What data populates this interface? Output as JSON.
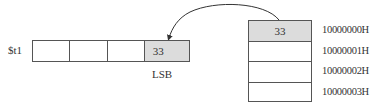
{
  "register": {
    "name": "$t1",
    "bytes": [
      "",
      "",
      "",
      "33"
    ],
    "lsb_label": "LSB"
  },
  "memory": {
    "cells": [
      "33",
      "",
      "",
      ""
    ],
    "addresses": [
      "10000000H",
      "10000001H",
      "10000002H",
      "10000003H"
    ]
  },
  "colors": {
    "shaded": "#dcdcdc",
    "line": "#555555"
  }
}
